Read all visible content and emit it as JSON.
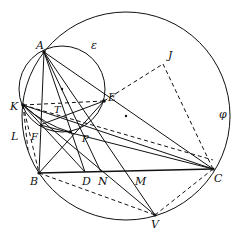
{
  "figure": {
    "type": "geometry-diagram",
    "circles": [
      {
        "name": "phi",
        "label": "φ",
        "cx": 126,
        "cy": 116,
        "r": 104
      },
      {
        "name": "epsilon",
        "label": "ε",
        "cx": 62,
        "cy": 89,
        "r": 43
      }
    ],
    "points": {
      "A": {
        "label": "A",
        "x": 44,
        "y": 52
      },
      "B": {
        "label": "B",
        "x": 39,
        "y": 173
      },
      "C": {
        "label": "C",
        "x": 213,
        "y": 169
      },
      "D": {
        "label": "D",
        "x": 85,
        "y": 172
      },
      "E": {
        "label": "E",
        "x": 104,
        "y": 101
      },
      "F": {
        "label": "F",
        "x": 40,
        "y": 125
      },
      "J": {
        "label": "J",
        "x": 163,
        "y": 64
      },
      "K": {
        "label": "K",
        "x": 23,
        "y": 105
      },
      "L": {
        "label": "L",
        "x": 22,
        "y": 134
      },
      "M": {
        "label": "M",
        "x": 127,
        "y": 172
      },
      "N": {
        "label": "N",
        "x": 101,
        "y": 172
      },
      "P": {
        "label": "P",
        "x": 70,
        "y": 132
      },
      "T": {
        "label": "T",
        "x": 58,
        "y": 117
      },
      "V": {
        "label": "V",
        "x": 155,
        "y": 215
      }
    },
    "center_dots": [
      {
        "of": "epsilon",
        "x": 62,
        "y": 89
      },
      {
        "of": "phi",
        "x": 126,
        "y": 116
      }
    ]
  }
}
